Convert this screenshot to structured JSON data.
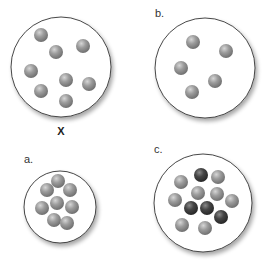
{
  "figure": {
    "colors": {
      "container_stroke": "#333333",
      "light_particle": "#9a9a9a",
      "dark_particle": "#3f3f3f"
    },
    "panels": [
      {
        "id": "x",
        "label": "X",
        "particles": {
          "light": 8,
          "dark": 0
        },
        "arrangement": "spread out"
      },
      {
        "id": "b",
        "label": "b.",
        "particles": {
          "light": 5,
          "dark": 0
        },
        "arrangement": "spread out"
      },
      {
        "id": "a",
        "label": "a.",
        "particles": {
          "light": 8,
          "dark": 0
        },
        "arrangement": "tightly packed"
      },
      {
        "id": "c",
        "label": "c.",
        "particles": {
          "light": 8,
          "dark": 4
        },
        "arrangement": "tightly packed, mixed"
      }
    ]
  }
}
